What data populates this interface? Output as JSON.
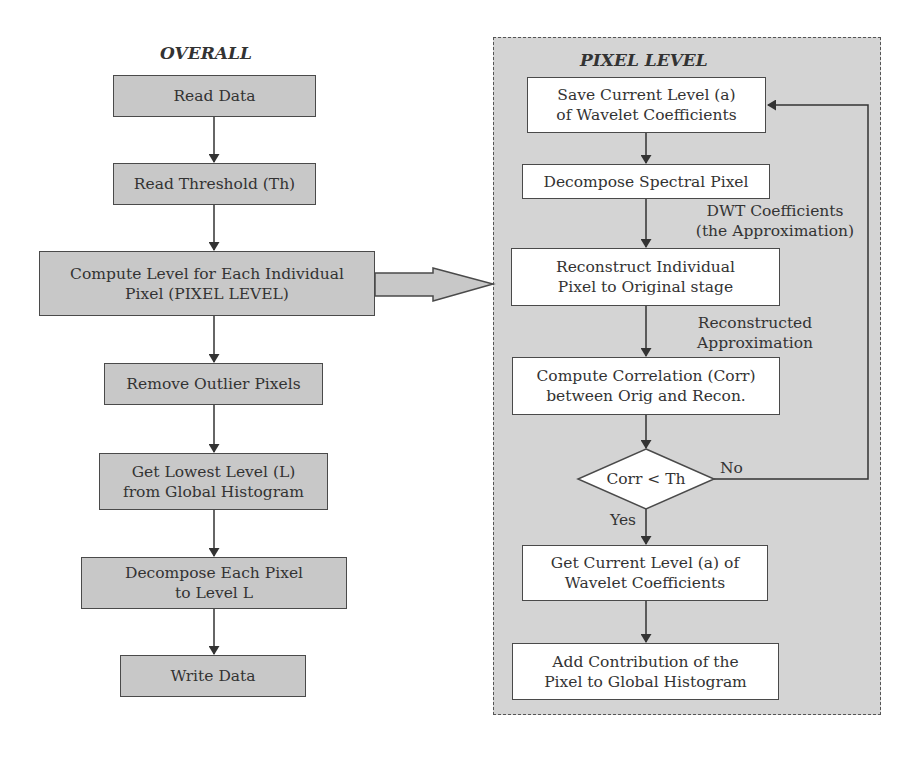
{
  "overall": {
    "title": "OVERALL",
    "steps": [
      {
        "label": "Read Data"
      },
      {
        "label": "Read Threshold (Th)"
      },
      {
        "label": "Compute Level for Each Individual\nPixel (PIXEL LEVEL)"
      },
      {
        "label": "Remove Outlier Pixels"
      },
      {
        "label": "Get Lowest Level (L)\nfrom Global Histogram"
      },
      {
        "label": "Decompose Each Pixel\nto Level L"
      },
      {
        "label": "Write Data"
      }
    ]
  },
  "pixel_level": {
    "title": "PIXEL LEVEL",
    "steps": [
      {
        "label": "Save Current Level (a)\nof Wavelet Coefficients"
      },
      {
        "label": "Decompose Spectral Pixel"
      },
      {
        "label": "Reconstruct Individual\nPixel to Original stage"
      },
      {
        "label": "Compute Correlation (Corr)\nbetween Orig and Recon."
      },
      {
        "label": "Get Current Level (a) of\nWavelet Coefficients"
      },
      {
        "label": "Add Contribution of the\nPixel to Global Histogram"
      }
    ],
    "decision": {
      "label": "Corr < Th",
      "yes": "Yes",
      "no": "No"
    },
    "edge_labels": {
      "dwt": "DWT Coefficients\n(the Approximation)",
      "reconstructed": "Reconstructed\nApproximation"
    }
  },
  "colors": {
    "gray_box": "#c8c8c8",
    "panel_bg": "#d4d4d4",
    "line": "#333333"
  }
}
